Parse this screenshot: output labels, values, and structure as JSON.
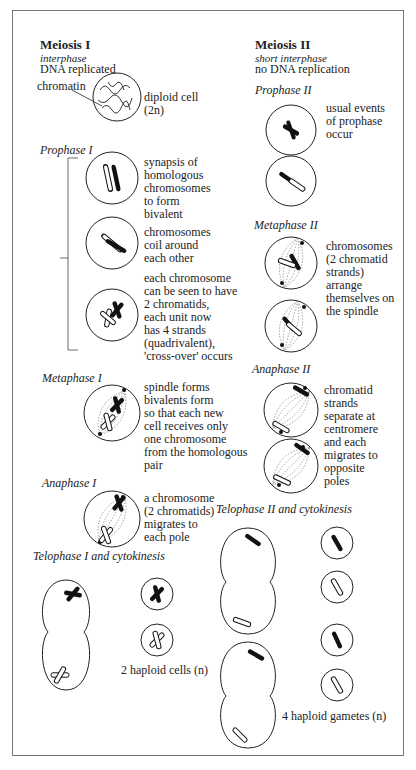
{
  "meiosis1": {
    "title": "Meiosis I",
    "subtitle": "interphase",
    "note": "DNA replicated",
    "chromatin_label": "chromatin",
    "diploid_label": "diploid cell\n(2n)",
    "prophase": {
      "label": "Prophase I",
      "stages": [
        "synapsis of\nhomologous\nchromosomes\nto form\nbivalent",
        "chromosomes\ncoil around\neach other",
        "each chromosome\ncan be seen to have\n2 chromatids,\neach unit now\nhas 4 strands\n(quadrivalent),\n'cross-over' occurs"
      ]
    },
    "metaphase": {
      "label": "Metaphase I",
      "text": "spindle forms\nbivalents form\nso that each new\ncell receives only\none chromosome\nfrom the homologous\npair"
    },
    "anaphase": {
      "label": "Anaphase I",
      "text": "a chromosome\n(2 chromatids)\nmigrates to\neach pole"
    },
    "telophase": {
      "label": "Telophase I and cytokinesis",
      "result": "2 haploid cells (n)"
    }
  },
  "meiosis2": {
    "title": "Meiosis II",
    "subtitle": "short interphase",
    "note": "no DNA replication",
    "prophase": {
      "label": "Prophase II",
      "text": "usual events\nof prophase\noccur"
    },
    "metaphase": {
      "label": "Metaphase II",
      "text": "chromosomes\n(2 chromatid\nstrands)\narrange\nthemselves on\nthe spindle"
    },
    "anaphase": {
      "label": "Anaphase II",
      "text": "chromatid\nstrands\nseparate at\ncentromere\nand each\nmigrates to\nopposite\npoles"
    },
    "telophase": {
      "label": "Telophase II and cytokinesis",
      "result": "4 haploid gametes (n)"
    }
  }
}
